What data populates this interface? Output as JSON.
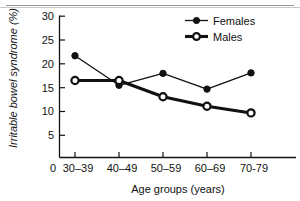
{
  "chart_data": {
    "type": "line",
    "title": "",
    "xlabel": "Age groups (years)",
    "ylabel": "Irritable bowel syndrome (%)",
    "categories": [
      "30–39",
      "40–49",
      "50–59",
      "60–69",
      "70-79"
    ],
    "origin_label": "0",
    "ylim": [
      0,
      30
    ],
    "yticks": [
      30,
      25,
      20,
      15,
      10,
      5
    ],
    "ytick_labels": [
      "30",
      "25",
      "20",
      "15",
      "10",
      "5"
    ],
    "grid": false,
    "legend_position": "top-right",
    "series": [
      {
        "name": "Females",
        "values": [
          21.7,
          15.5,
          18.0,
          14.7,
          18.1
        ],
        "marker": "filled-circle",
        "line_width": "thin",
        "color": "#111111"
      },
      {
        "name": "Males",
        "values": [
          16.5,
          16.5,
          13.1,
          11.1,
          9.7
        ],
        "marker": "open-circle",
        "line_width": "thick",
        "color": "#111111"
      }
    ]
  },
  "legend": {
    "entries": [
      {
        "label": "Females"
      },
      {
        "label": "Males"
      }
    ]
  },
  "axes": {
    "x_title": "Age groups (years)",
    "y_title": "Irritable bowel syndrome (%)",
    "x_tick_labels": [
      "30–39",
      "40–49",
      "50–59",
      "60–69",
      "70-79"
    ],
    "y_tick_labels": [
      "30",
      "25",
      "20",
      "15",
      "10",
      "5"
    ],
    "origin_label": "0"
  }
}
